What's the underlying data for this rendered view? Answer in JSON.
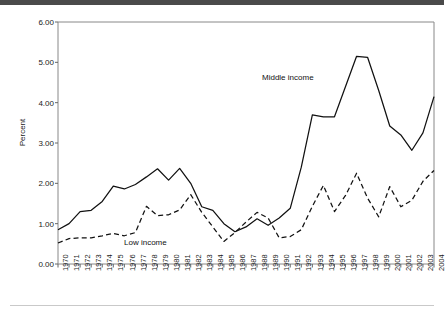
{
  "figure": {
    "ylabel": "Percent",
    "top_rule_color": "#4a4a4a",
    "bottom_rule_color": "#c9c9c9",
    "line_color": "#111111"
  },
  "annotations": {
    "middle": "Middle income",
    "low": "Low income"
  },
  "chart_data": {
    "type": "line",
    "title": "",
    "xlabel": "",
    "ylabel": "Percent",
    "ylim": [
      0.0,
      6.0
    ],
    "yticks": [
      0.0,
      1.0,
      2.0,
      3.0,
      4.0,
      5.0,
      6.0
    ],
    "ytick_labels": [
      "0.00",
      "1.00",
      "2.00",
      "3.00",
      "4.00",
      "5.00",
      "6.00"
    ],
    "grid": false,
    "legend_position": "inline-annotation",
    "categories": [
      "1970",
      "1971",
      "1972",
      "1973",
      "1974",
      "1975",
      "1976",
      "1977",
      "1978",
      "1979",
      "1980",
      "1981",
      "1982",
      "1983",
      "1984",
      "1985",
      "1986",
      "1987",
      "1988",
      "1989",
      "1990",
      "1991",
      "1992",
      "1993",
      "1994",
      "1995",
      "1996",
      "1997",
      "1998",
      "1999",
      "2000",
      "2001",
      "2002",
      "2003",
      "2004"
    ],
    "series": [
      {
        "name": "Middle income",
        "style": "solid",
        "values": [
          0.85,
          1.0,
          1.3,
          1.33,
          1.55,
          1.93,
          1.86,
          1.97,
          2.16,
          2.36,
          2.08,
          2.37,
          2.0,
          1.42,
          1.33,
          1.0,
          0.8,
          0.92,
          1.12,
          0.96,
          1.14,
          1.38,
          2.4,
          3.7,
          3.65,
          3.65,
          4.4,
          5.15,
          5.12,
          4.3,
          3.42,
          3.2,
          2.82,
          3.25,
          4.15
        ]
      },
      {
        "name": "Low income",
        "style": "dashed",
        "values": [
          0.52,
          0.63,
          0.65,
          0.65,
          0.7,
          0.76,
          0.7,
          0.78,
          1.43,
          1.2,
          1.22,
          1.34,
          1.72,
          1.28,
          0.92,
          0.56,
          0.78,
          1.04,
          1.28,
          1.14,
          0.65,
          0.68,
          0.85,
          1.43,
          1.95,
          1.3,
          1.7,
          2.25,
          1.63,
          1.17,
          1.92,
          1.42,
          1.58,
          2.05,
          2.32
        ]
      }
    ]
  }
}
